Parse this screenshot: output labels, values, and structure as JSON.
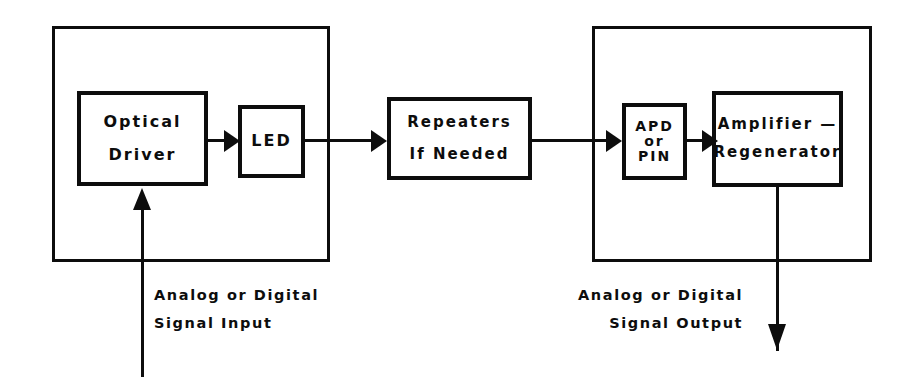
{
  "diagram": {
    "stroke_color": "#0d0d0d",
    "background_color": "#ffffff"
  },
  "transmitter": {
    "group_name": "Transmitter Enclosure",
    "optical_driver": {
      "line1": "Optical",
      "line2": "Driver"
    },
    "led": {
      "line1": "LED"
    }
  },
  "link": {
    "repeaters": {
      "line1": "Repeaters",
      "line2": "If Needed"
    }
  },
  "receiver": {
    "group_name": "Receiver Enclosure",
    "detector": {
      "line1": "APD",
      "line2": "or",
      "line3": "PIN"
    },
    "amplifier": {
      "line1": "Amplifier —",
      "line2": "Regenerator"
    }
  },
  "captions": {
    "input": {
      "line1": "Analog  or  Digital",
      "line2": "Signal  Input"
    },
    "output": {
      "line1": "Analog or  Digital",
      "line2": "Signal  Output"
    }
  }
}
